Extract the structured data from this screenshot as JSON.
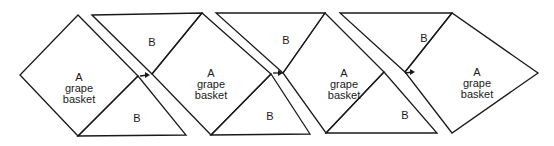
{
  "diagram": {
    "blocks": [
      {
        "id": "A1",
        "label_letter": "A",
        "label_line1": "grape",
        "label_line2": "basket"
      },
      {
        "id": "A2",
        "label_letter": "A",
        "label_line1": "grape",
        "label_line2": "basket"
      },
      {
        "id": "A3",
        "label_letter": "A",
        "label_line1": "grape",
        "label_line2": "basket"
      },
      {
        "id": "A4",
        "label_letter": "A",
        "label_line1": "grape",
        "label_line2": "basket"
      }
    ],
    "triangles_top": [
      {
        "id": "Bt1",
        "label": "B"
      },
      {
        "id": "Bt2",
        "label": "B"
      },
      {
        "id": "Bt3",
        "label": "B"
      }
    ],
    "triangles_bottom": [
      {
        "id": "Bb1",
        "label": "B"
      },
      {
        "id": "Bb2",
        "label": "B"
      },
      {
        "id": "Bb3",
        "label": "B"
      }
    ],
    "arrows": [
      {
        "id": "arrow1",
        "direction": "right"
      },
      {
        "id": "arrow2",
        "direction": "right"
      },
      {
        "id": "arrow3",
        "direction": "right"
      }
    ]
  }
}
